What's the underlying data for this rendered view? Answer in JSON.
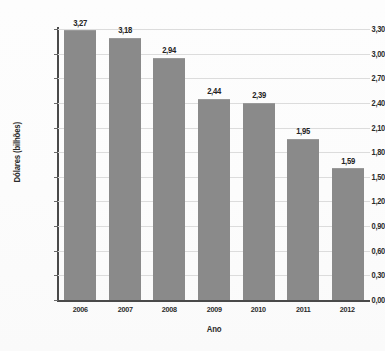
{
  "chart_data": {
    "type": "bar",
    "title": "",
    "subtitle": "",
    "xlabel": "Ano",
    "ylabel": "Dólares (bilhões)",
    "categories": [
      "2006",
      "2007",
      "2008",
      "2009",
      "2010",
      "2011",
      "2012"
    ],
    "values": [
      3.27,
      3.18,
      2.94,
      2.44,
      2.39,
      1.95,
      1.59
    ],
    "value_labels": [
      "3,27",
      "3,18",
      "2,94",
      "2,44",
      "2,39",
      "1,95",
      "1,59"
    ],
    "ylim": [
      0,
      3.3
    ],
    "ytick_step": 0.3,
    "ytick_labels": [
      "0,00",
      "0,30",
      "0,60",
      "0,90",
      "1,20",
      "1,50",
      "1,80",
      "2,10",
      "2,40",
      "2,70",
      "3,00",
      "3,30"
    ],
    "ytick_values": [
      0,
      0.3,
      0.6,
      0.9,
      1.2,
      1.5,
      1.8,
      2.1,
      2.4,
      2.7,
      3.0,
      3.3
    ],
    "grid": true,
    "grid_axis": "y",
    "legend": false,
    "legend_position": "none",
    "decimal_separator": ",",
    "colors": {
      "bar": "#8a8a8a",
      "bar_edge": "#9a9a9a",
      "gridline": "#dcdcdc",
      "axis": "#4a4a4a",
      "text": "#2b2b2b",
      "background": "#fdfdfd"
    }
  }
}
